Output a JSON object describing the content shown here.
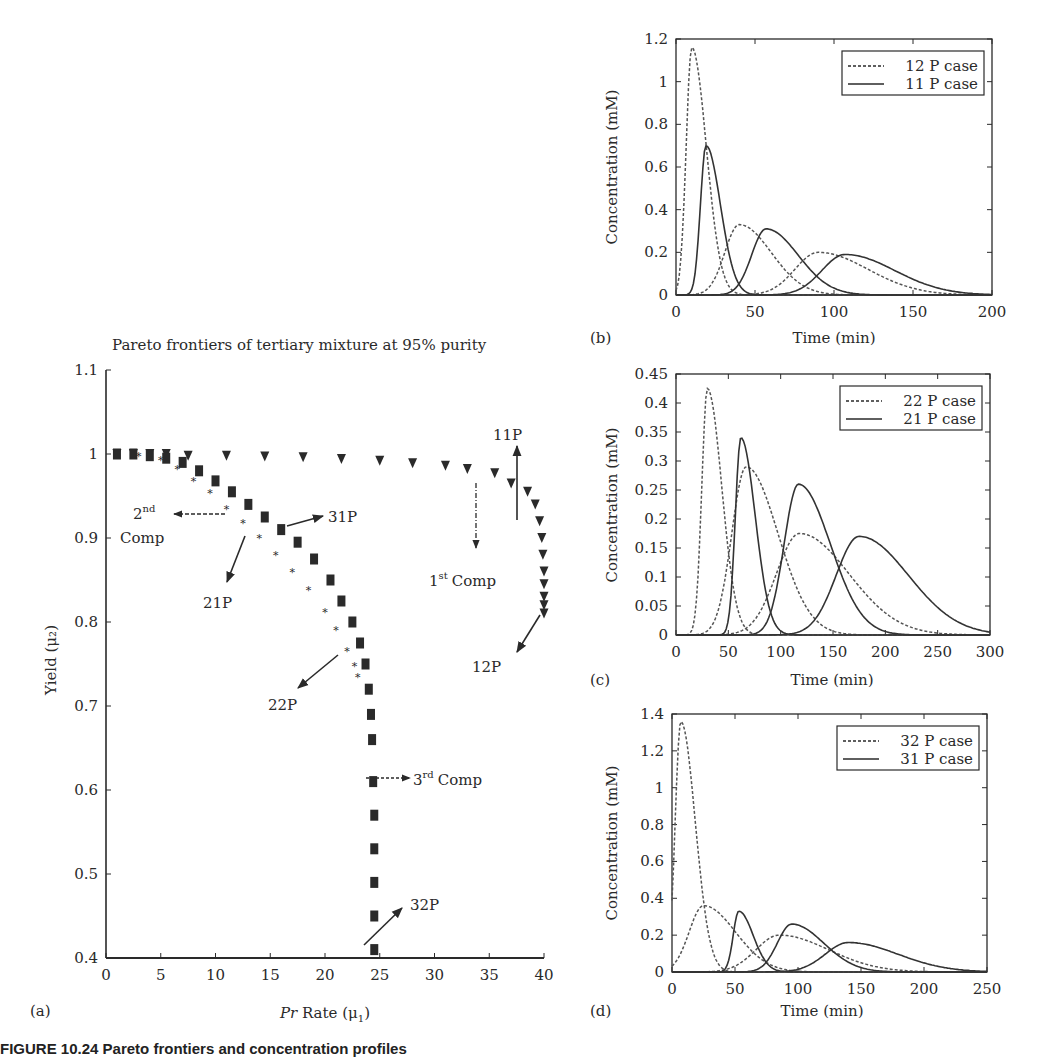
{
  "figure": {
    "caption_fragment": "FIGURE 10.24    Pareto frontiers and concentration profiles"
  },
  "panels": {
    "a": {
      "label": "(a)",
      "title": "Pareto frontiers of tertiary mixture at 95% purity",
      "xlabel_italic": "Pr",
      "xlabel_rest": " Rate (μ",
      "xlabel_sub": "1",
      "xlabel_close": ")",
      "ylabel": "Yield (μ₂)",
      "annotations": {
        "a11p": "11P",
        "a12p": "12P",
        "a21p": "21P",
        "a22p": "22P",
        "a31p": "31P",
        "a32p": "32P",
        "first_comp_num": "1",
        "first_comp_sup": "st",
        "first_comp_word": "Comp",
        "second_comp_num": "2",
        "second_comp_sup": "nd",
        "second_comp_word": "Comp",
        "third_comp_num": "3",
        "third_comp_sup": "rd",
        "third_comp_word": "Comp"
      }
    },
    "b": {
      "label": "(b)",
      "xlabel": "Time (min)",
      "ylabel": "Concentration (mM)",
      "legend": [
        "12 P case",
        "11 P case"
      ]
    },
    "c": {
      "label": "(c)",
      "xlabel": "Time (min)",
      "ylabel": "Concentration (mM)",
      "legend": [
        "22 P case",
        "21 P case"
      ]
    },
    "d": {
      "label": "(d)",
      "xlabel": "Time (min)",
      "ylabel": "Concentration (mM)",
      "legend": [
        "32 P case",
        "31 P case"
      ]
    }
  },
  "chart_data": [
    {
      "id": "a",
      "type": "scatter",
      "title": "Pareto frontiers of tertiary mixture at 95% purity",
      "xlabel": "Pr Rate (μ1)",
      "ylabel": "Yield (μ2)",
      "xlim": [
        0,
        40
      ],
      "ylim": [
        0.4,
        1.1
      ],
      "xticks": [
        0,
        5,
        10,
        15,
        20,
        25,
        30,
        35,
        40
      ],
      "yticks": [
        0.4,
        0.5,
        0.6,
        0.7,
        0.8,
        0.9,
        1.0,
        1.1
      ],
      "grid": false,
      "series": [
        {
          "name": "1st Comp (11P to 12P)",
          "marker": "triangle-down",
          "x": [
            1,
            2.5,
            4,
            5.5,
            7.5,
            11,
            14.5,
            18,
            21.5,
            25,
            28,
            31,
            33,
            35.5,
            37,
            38.5,
            39.2,
            39.6,
            39.8,
            39.9,
            40,
            40,
            40,
            40,
            40
          ],
          "y": [
            1.0,
            1.0,
            1.0,
            1.0,
            0.998,
            0.998,
            0.997,
            0.996,
            0.994,
            0.992,
            0.989,
            0.986,
            0.982,
            0.977,
            0.965,
            0.955,
            0.94,
            0.92,
            0.9,
            0.88,
            0.86,
            0.845,
            0.83,
            0.82,
            0.81
          ]
        },
        {
          "name": "2nd Comp (21P to 22P)",
          "marker": "star",
          "x": [
            1,
            3,
            5,
            6.5,
            8,
            9.5,
            11,
            12.5,
            14,
            15.5,
            17,
            18.5,
            20,
            21,
            22,
            22.7,
            23
          ],
          "y": [
            1.0,
            0.998,
            0.993,
            0.982,
            0.968,
            0.953,
            0.935,
            0.918,
            0.9,
            0.88,
            0.86,
            0.838,
            0.812,
            0.79,
            0.765,
            0.748,
            0.735
          ]
        },
        {
          "name": "3rd Comp (31P to 32P)",
          "marker": "square",
          "x": [
            1,
            2.5,
            4,
            5.5,
            7,
            8.5,
            10,
            11.5,
            13,
            14.5,
            16,
            17.5,
            19,
            20.5,
            21.5,
            22.5,
            23.2,
            23.7,
            24,
            24.2,
            24.3,
            24.4,
            24.5,
            24.5,
            24.5,
            24.5,
            24.5
          ],
          "y": [
            1.0,
            1.0,
            0.998,
            0.995,
            0.99,
            0.98,
            0.968,
            0.955,
            0.94,
            0.925,
            0.91,
            0.895,
            0.875,
            0.85,
            0.825,
            0.8,
            0.775,
            0.75,
            0.72,
            0.69,
            0.66,
            0.61,
            0.57,
            0.53,
            0.49,
            0.45,
            0.41
          ]
        }
      ],
      "annotations": [
        "11P",
        "12P",
        "21P",
        "22P",
        "31P",
        "32P",
        "1st Comp",
        "2nd Comp",
        "3rd Comp"
      ]
    },
    {
      "id": "b",
      "type": "line",
      "xlabel": "Time (min)",
      "ylabel": "Concentration (mM)",
      "xlim": [
        0,
        200
      ],
      "ylim": [
        0,
        1.2
      ],
      "xticks": [
        0,
        50,
        100,
        150,
        200
      ],
      "yticks": [
        0,
        0.2,
        0.4,
        0.6,
        0.8,
        1,
        1.2
      ],
      "legend_position": "upper right",
      "series": [
        {
          "name": "12 P case",
          "style": "dashed",
          "peaks": [
            {
              "t": 10,
              "c": 1.16
            },
            {
              "t": 40,
              "c": 0.33
            },
            {
              "t": 90,
              "c": 0.2
            }
          ]
        },
        {
          "name": "11 P case",
          "style": "solid",
          "peaks": [
            {
              "t": 19,
              "c": 0.7
            },
            {
              "t": 57,
              "c": 0.31
            },
            {
              "t": 107,
              "c": 0.19
            }
          ]
        }
      ]
    },
    {
      "id": "c",
      "type": "line",
      "xlabel": "Time (min)",
      "ylabel": "Concentration (mM)",
      "xlim": [
        0,
        300
      ],
      "ylim": [
        0,
        0.45
      ],
      "xticks": [
        0,
        50,
        100,
        150,
        200,
        250,
        300
      ],
      "yticks": [
        0,
        0.05,
        0.1,
        0.15,
        0.2,
        0.25,
        0.3,
        0.35,
        0.4,
        0.45
      ],
      "legend_position": "upper right",
      "series": [
        {
          "name": "22 P case",
          "style": "dashed",
          "peaks": [
            {
              "t": 30,
              "c": 0.425
            },
            {
              "t": 67,
              "c": 0.29
            },
            {
              "t": 118,
              "c": 0.175
            }
          ]
        },
        {
          "name": "21 P case",
          "style": "solid",
          "peaks": [
            {
              "t": 62,
              "c": 0.34
            },
            {
              "t": 117,
              "c": 0.26
            },
            {
              "t": 175,
              "c": 0.17
            }
          ]
        }
      ]
    },
    {
      "id": "d",
      "type": "line",
      "xlabel": "Time (min)",
      "ylabel": "Concentration (mM)",
      "xlim": [
        0,
        250
      ],
      "ylim": [
        0,
        1.4
      ],
      "xticks": [
        0,
        50,
        100,
        150,
        200,
        250
      ],
      "yticks": [
        0,
        0.2,
        0.4,
        0.6,
        0.8,
        1,
        1.2,
        1.4
      ],
      "legend_position": "upper right",
      "series": [
        {
          "name": "32 P case",
          "style": "dashed",
          "peaks": [
            {
              "t": 7,
              "c": 1.36
            },
            {
              "t": 25,
              "c": 0.36
            },
            {
              "t": 85,
              "c": 0.2
            }
          ]
        },
        {
          "name": "31 P case",
          "style": "solid",
          "peaks": [
            {
              "t": 53,
              "c": 0.33
            },
            {
              "t": 95,
              "c": 0.26
            },
            {
              "t": 140,
              "c": 0.16
            }
          ]
        }
      ]
    }
  ]
}
